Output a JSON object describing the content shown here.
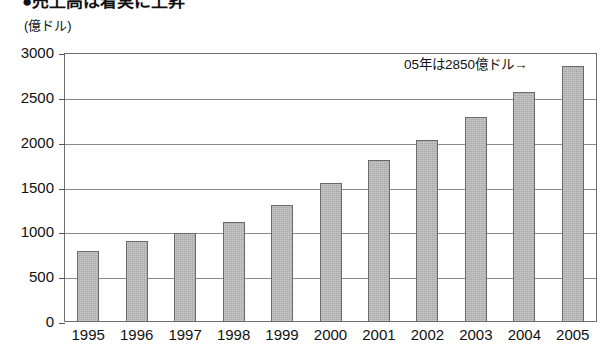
{
  "heading": {
    "text": "●売上高は着実に上昇"
  },
  "unit_label": "(億ドル)",
  "annotation": "05年は2850億ドル→",
  "chart_data": {
    "type": "bar",
    "title": "",
    "subtitle": "",
    "xlabel": "",
    "ylabel": "(億ドル)",
    "ylim": [
      0,
      3000
    ],
    "yticks": [
      0,
      500,
      1000,
      1500,
      2000,
      2500,
      3000
    ],
    "ytick_labels": [
      "0",
      "500",
      "1000",
      "1500",
      "2000",
      "2500",
      "3000"
    ],
    "grid": true,
    "legend": null,
    "categories": [
      "1995",
      "1996",
      "1997",
      "1998",
      "1999",
      "2000",
      "2001",
      "2002",
      "2003",
      "2004",
      "2005"
    ],
    "values": [
      790,
      900,
      990,
      1120,
      1300,
      1550,
      1810,
      2030,
      2285,
      2560,
      2850
    ],
    "annotations": [
      {
        "text": "05年は2850億ドル→",
        "target_category": "2005",
        "value": 2850
      }
    ],
    "bar_color": "#a9a9a9",
    "bar_border_color": "#6a6a6a",
    "axis_color": "#6e6e6e",
    "grid_color": "#8a8a8a",
    "background": "#ffffff"
  }
}
